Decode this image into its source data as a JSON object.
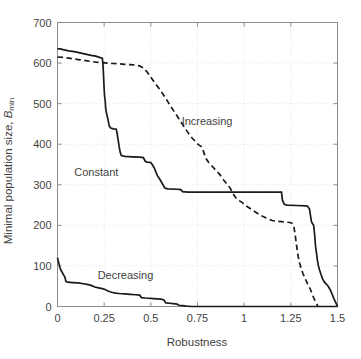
{
  "chart_data": {
    "type": "line",
    "title": "",
    "xlabel": "Robustness",
    "ylabel": "Minimal population size, B_min",
    "ylabel_main": "Minimal population size, ",
    "ylabel_symbol": "B",
    "ylabel_subscript": "min",
    "xlim": [
      0,
      1.5
    ],
    "ylim": [
      0,
      700
    ],
    "grid": true,
    "legend_position": "inline-annotations",
    "xticks": [
      0,
      0.25,
      0.5,
      0.75,
      1,
      1.25,
      1.5
    ],
    "xtick_labels": [
      "0",
      "0.25",
      "0.5",
      "0.75",
      "1",
      "1.25",
      "1.5"
    ],
    "yticks": [
      0,
      100,
      200,
      300,
      400,
      500,
      600,
      700
    ],
    "ytick_labels": [
      "0",
      "100",
      "200",
      "300",
      "400",
      "500",
      "600",
      "700"
    ],
    "line_color": "#1a1a1a",
    "grid_color": "#d8d8d8",
    "axis_color": "#8c8c8c",
    "series": [
      {
        "name": "Constant",
        "style": "solid",
        "annotation": "Constant",
        "annotation_x": 0.09,
        "annotation_y": 328,
        "points": [
          [
            0.0,
            635
          ],
          [
            0.015,
            635
          ],
          [
            0.03,
            633
          ],
          [
            0.06,
            630
          ],
          [
            0.09,
            628
          ],
          [
            0.12,
            625
          ],
          [
            0.15,
            622
          ],
          [
            0.18,
            619
          ],
          [
            0.205,
            617
          ],
          [
            0.225,
            614
          ],
          [
            0.24,
            612
          ],
          [
            0.243,
            600
          ],
          [
            0.246,
            575
          ],
          [
            0.248,
            555
          ],
          [
            0.25,
            535
          ],
          [
            0.252,
            520
          ],
          [
            0.256,
            505
          ],
          [
            0.258,
            488
          ],
          [
            0.262,
            478
          ],
          [
            0.266,
            470
          ],
          [
            0.27,
            462
          ],
          [
            0.274,
            452
          ],
          [
            0.278,
            444
          ],
          [
            0.285,
            440
          ],
          [
            0.3,
            438
          ],
          [
            0.315,
            437
          ],
          [
            0.32,
            425
          ],
          [
            0.325,
            410
          ],
          [
            0.33,
            395
          ],
          [
            0.336,
            380
          ],
          [
            0.342,
            372
          ],
          [
            0.36,
            370
          ],
          [
            0.4,
            369
          ],
          [
            0.44,
            368
          ],
          [
            0.46,
            367
          ],
          [
            0.47,
            358
          ],
          [
            0.48,
            356
          ],
          [
            0.5,
            355
          ],
          [
            0.51,
            348
          ],
          [
            0.52,
            340
          ],
          [
            0.528,
            330
          ],
          [
            0.536,
            322
          ],
          [
            0.545,
            316
          ],
          [
            0.555,
            308
          ],
          [
            0.565,
            300
          ],
          [
            0.575,
            292
          ],
          [
            0.59,
            290
          ],
          [
            0.64,
            289
          ],
          [
            0.66,
            288
          ],
          [
            0.67,
            283
          ],
          [
            0.7,
            282
          ],
          [
            0.8,
            282
          ],
          [
            0.9,
            282
          ],
          [
            1.0,
            282
          ],
          [
            1.1,
            282
          ],
          [
            1.18,
            282
          ],
          [
            1.2,
            282
          ],
          [
            1.205,
            262
          ],
          [
            1.215,
            252
          ],
          [
            1.23,
            250
          ],
          [
            1.28,
            249
          ],
          [
            1.33,
            248
          ],
          [
            1.34,
            247
          ],
          [
            1.35,
            240
          ],
          [
            1.355,
            225
          ],
          [
            1.36,
            210
          ],
          [
            1.365,
            205
          ],
          [
            1.372,
            200
          ],
          [
            1.378,
            175
          ],
          [
            1.382,
            150
          ],
          [
            1.388,
            130
          ],
          [
            1.392,
            115
          ],
          [
            1.398,
            100
          ],
          [
            1.404,
            90
          ],
          [
            1.412,
            78
          ],
          [
            1.42,
            68
          ],
          [
            1.43,
            60
          ],
          [
            1.44,
            55
          ],
          [
            1.45,
            50
          ],
          [
            1.46,
            42
          ],
          [
            1.47,
            32
          ],
          [
            1.48,
            20
          ],
          [
            1.49,
            10
          ],
          [
            1.5,
            0
          ]
        ]
      },
      {
        "name": "Increasing",
        "style": "dashed",
        "annotation": "Increasing",
        "annotation_x": 0.665,
        "annotation_y": 455,
        "points": [
          [
            0.0,
            615
          ],
          [
            0.03,
            614
          ],
          [
            0.06,
            612
          ],
          [
            0.09,
            610
          ],
          [
            0.12,
            608
          ],
          [
            0.15,
            606
          ],
          [
            0.18,
            604
          ],
          [
            0.21,
            602
          ],
          [
            0.24,
            601
          ],
          [
            0.27,
            600
          ],
          [
            0.3,
            599
          ],
          [
            0.33,
            598
          ],
          [
            0.36,
            597
          ],
          [
            0.39,
            596
          ],
          [
            0.42,
            595
          ],
          [
            0.44,
            593
          ],
          [
            0.46,
            588
          ],
          [
            0.48,
            578
          ],
          [
            0.5,
            565
          ],
          [
            0.52,
            552
          ],
          [
            0.54,
            540
          ],
          [
            0.56,
            527
          ],
          [
            0.58,
            513
          ],
          [
            0.6,
            498
          ],
          [
            0.62,
            484
          ],
          [
            0.64,
            470
          ],
          [
            0.66,
            456
          ],
          [
            0.68,
            442
          ],
          [
            0.7,
            428
          ],
          [
            0.72,
            416
          ],
          [
            0.74,
            406
          ],
          [
            0.755,
            399
          ],
          [
            0.765,
            396
          ],
          [
            0.775,
            393
          ],
          [
            0.785,
            378
          ],
          [
            0.795,
            365
          ],
          [
            0.81,
            355
          ],
          [
            0.83,
            345
          ],
          [
            0.85,
            335
          ],
          [
            0.87,
            325
          ],
          [
            0.89,
            312
          ],
          [
            0.91,
            300
          ],
          [
            0.925,
            292
          ],
          [
            0.94,
            278
          ],
          [
            0.955,
            268
          ],
          [
            0.97,
            262
          ],
          [
            0.99,
            256
          ],
          [
            1.01,
            248
          ],
          [
            1.03,
            242
          ],
          [
            1.05,
            236
          ],
          [
            1.07,
            230
          ],
          [
            1.09,
            224
          ],
          [
            1.11,
            220
          ],
          [
            1.13,
            216
          ],
          [
            1.15,
            212
          ],
          [
            1.175,
            210
          ],
          [
            1.2,
            209
          ],
          [
            1.225,
            208
          ],
          [
            1.245,
            207
          ],
          [
            1.258,
            205
          ],
          [
            1.266,
            198
          ],
          [
            1.272,
            180
          ],
          [
            1.278,
            160
          ],
          [
            1.284,
            140
          ],
          [
            1.29,
            122
          ],
          [
            1.298,
            106
          ],
          [
            1.306,
            92
          ],
          [
            1.316,
            80
          ],
          [
            1.328,
            68
          ],
          [
            1.34,
            56
          ],
          [
            1.352,
            45
          ],
          [
            1.362,
            34
          ],
          [
            1.372,
            22
          ],
          [
            1.382,
            12
          ],
          [
            1.39,
            5
          ],
          [
            1.395,
            0
          ]
        ]
      },
      {
        "name": "Decreasing",
        "style": "solid",
        "annotation": "Decreasing",
        "annotation_x": 0.215,
        "annotation_y": 75,
        "points": [
          [
            0.0,
            120
          ],
          [
            0.004,
            112
          ],
          [
            0.008,
            105
          ],
          [
            0.012,
            98
          ],
          [
            0.016,
            92
          ],
          [
            0.02,
            88
          ],
          [
            0.025,
            84
          ],
          [
            0.03,
            80
          ],
          [
            0.035,
            76
          ],
          [
            0.04,
            72
          ],
          [
            0.045,
            62
          ],
          [
            0.055,
            60
          ],
          [
            0.08,
            59
          ],
          [
            0.11,
            58
          ],
          [
            0.14,
            56
          ],
          [
            0.165,
            54
          ],
          [
            0.18,
            52
          ],
          [
            0.2,
            48
          ],
          [
            0.22,
            46
          ],
          [
            0.24,
            44
          ],
          [
            0.255,
            42
          ],
          [
            0.27,
            38
          ],
          [
            0.29,
            35
          ],
          [
            0.31,
            33
          ],
          [
            0.33,
            32
          ],
          [
            0.36,
            31
          ],
          [
            0.39,
            30
          ],
          [
            0.42,
            29
          ],
          [
            0.44,
            28
          ],
          [
            0.45,
            22
          ],
          [
            0.47,
            21
          ],
          [
            0.5,
            20
          ],
          [
            0.53,
            19
          ],
          [
            0.555,
            18
          ],
          [
            0.57,
            16
          ],
          [
            0.58,
            9
          ],
          [
            0.6,
            8
          ],
          [
            0.62,
            7
          ],
          [
            0.64,
            6
          ],
          [
            0.65,
            3
          ],
          [
            0.67,
            2
          ],
          [
            0.69,
            1
          ],
          [
            0.72,
            0
          ],
          [
            0.8,
            0
          ],
          [
            1.0,
            0
          ],
          [
            1.2,
            0
          ],
          [
            1.4,
            0
          ],
          [
            1.5,
            0
          ]
        ]
      }
    ]
  }
}
